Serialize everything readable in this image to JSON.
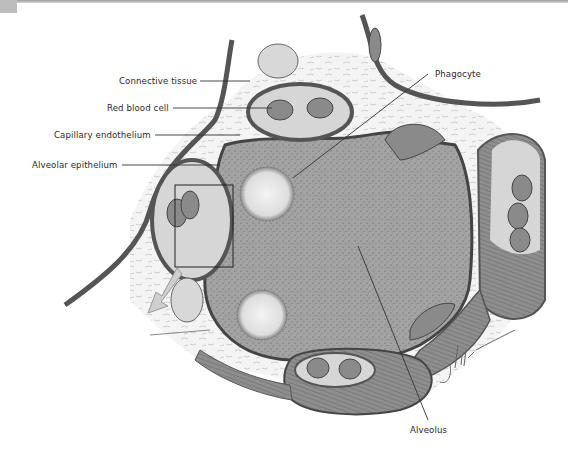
{
  "figure": {
    "labels": {
      "connective_tissue": "Connective tissue",
      "red_blood_cell": "Red blood cell",
      "capillary_endothelium": "Capillary endothelium",
      "alveolar_epithelium": "Alveolar  epithelium",
      "phagocyte": "Phagocyte",
      "alveolus": "Alveolus"
    },
    "signature": "J Kulks",
    "colors": {
      "alveolus_fill": "#9c9c9c",
      "wall": "#555555",
      "capillary_fill": "#d6d6d6",
      "rbc_fill": "#8a8a8a",
      "connective_tissue": "#f3f3f3",
      "phagocyte": "#eeeeee",
      "arrow": "#c8c8c8"
    }
  }
}
